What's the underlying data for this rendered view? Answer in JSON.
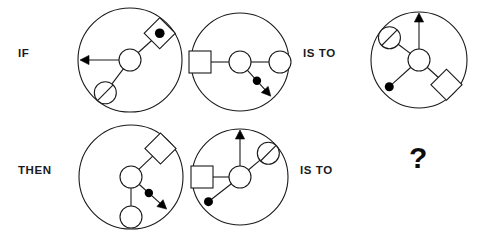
{
  "figure": {
    "type": "visual-analogy-puzzle",
    "background_color": "#ffffff",
    "stroke_color": "#1a1a1a",
    "fill_black": "#000000",
    "width": 479,
    "height": 234
  },
  "labels": {
    "if": "IF",
    "then": "THEN",
    "is_to_top": "IS TO",
    "is_to_bottom": "IS TO",
    "question": "?"
  },
  "panels": [
    {
      "id": "if-left",
      "row": "top",
      "position": "left",
      "cx": 130,
      "cy": 60,
      "r": 52,
      "hub_r": 11,
      "spokes": [
        {
          "name": "arrow-west",
          "terminal": "arrow",
          "angle_deg": 180,
          "length": 50,
          "has_midpoint_dot": false
        },
        {
          "name": "diamond-with-dot-northeast",
          "terminal": "diamond-dot",
          "angle_deg": 42,
          "length": 40,
          "size": 11,
          "has_midpoint_dot": false
        },
        {
          "name": "hatched-circle-southwest",
          "terminal": "hatched-circle",
          "angle_deg": 233,
          "length": 41,
          "size": 11,
          "has_midpoint_dot": false
        }
      ]
    },
    {
      "id": "if-right",
      "row": "top",
      "position": "middle",
      "cx": 240,
      "cy": 62,
      "r": 49,
      "hub_r": 11,
      "spokes": [
        {
          "name": "square-west",
          "terminal": "square",
          "angle_deg": 180,
          "length": 40,
          "size": 11,
          "has_midpoint_dot": false
        },
        {
          "name": "plain-circle-east",
          "terminal": "plain-circle",
          "angle_deg": 0,
          "length": 40,
          "size": 11,
          "has_midpoint_dot": false
        },
        {
          "name": "arrow-southeast-with-dot",
          "terminal": "arrow",
          "angle_deg": 312,
          "length": 46,
          "has_midpoint_dot": true,
          "dot_at": 0.55
        }
      ]
    },
    {
      "id": "is-to-top-answer",
      "row": "top",
      "position": "right",
      "cx": 419,
      "cy": 60,
      "r": 48,
      "hub_r": 11,
      "spokes": [
        {
          "name": "arrow-north",
          "terminal": "arrow",
          "angle_deg": 90,
          "length": 47,
          "has_midpoint_dot": false
        },
        {
          "name": "hatched-circle-northwest",
          "terminal": "hatched-circle",
          "angle_deg": 143,
          "length": 37,
          "size": 11,
          "has_midpoint_dot": false
        },
        {
          "name": "diamond-southeast",
          "terminal": "diamond",
          "angle_deg": 318,
          "length": 37,
          "size": 11,
          "has_midpoint_dot": false
        },
        {
          "name": "dot-southwest",
          "terminal": "dot",
          "angle_deg": 222,
          "length": 40,
          "size": 4.5,
          "has_midpoint_dot": false
        }
      ]
    },
    {
      "id": "then-left",
      "row": "bottom",
      "position": "left",
      "cx": 131,
      "cy": 177,
      "r": 52,
      "hub_r": 11,
      "spokes": [
        {
          "name": "diamond-northeast",
          "terminal": "diamond",
          "angle_deg": 44,
          "length": 41,
          "size": 11,
          "has_midpoint_dot": false
        },
        {
          "name": "plain-circle-south",
          "terminal": "plain-circle",
          "angle_deg": 270,
          "length": 40,
          "size": 11,
          "has_midpoint_dot": false
        },
        {
          "name": "arrow-southeast-with-dot",
          "terminal": "arrow",
          "angle_deg": 318,
          "length": 48,
          "has_midpoint_dot": true,
          "dot_at": 0.5
        }
      ]
    },
    {
      "id": "then-right",
      "row": "bottom",
      "position": "middle",
      "cx": 240,
      "cy": 177,
      "r": 48,
      "hub_r": 11,
      "spokes": [
        {
          "name": "arrow-north",
          "terminal": "arrow",
          "angle_deg": 90,
          "length": 47,
          "has_midpoint_dot": false
        },
        {
          "name": "square-west",
          "terminal": "square",
          "angle_deg": 180,
          "length": 38,
          "size": 11,
          "has_midpoint_dot": false
        },
        {
          "name": "hatched-circle-northeast",
          "terminal": "hatched-circle",
          "angle_deg": 40,
          "length": 37,
          "size": 11,
          "has_midpoint_dot": false
        },
        {
          "name": "dot-southwest",
          "terminal": "dot",
          "angle_deg": 218,
          "length": 40,
          "size": 4.5,
          "has_midpoint_dot": false
        }
      ]
    }
  ],
  "label_positions": {
    "if": {
      "x": 18,
      "y": 54
    },
    "then": {
      "x": 18,
      "y": 171
    },
    "is_to_top": {
      "x": 303,
      "y": 54
    },
    "is_to_bottom": {
      "x": 300,
      "y": 171
    },
    "question": {
      "x": 409,
      "y": 158
    }
  }
}
